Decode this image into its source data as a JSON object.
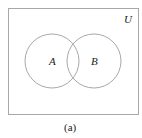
{
  "diagram": {
    "type": "venn",
    "universe_label": "U",
    "sets": [
      {
        "label": "A"
      },
      {
        "label": "B"
      }
    ],
    "caption": "(a)",
    "colors": {
      "stroke": "#a8a8a8",
      "text": "#222222"
    }
  }
}
